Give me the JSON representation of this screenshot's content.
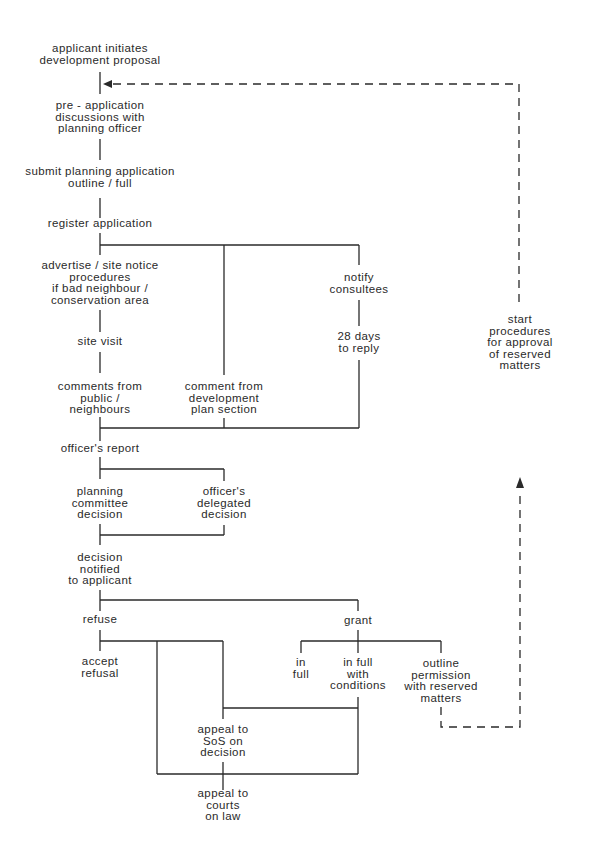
{
  "diagram": {
    "type": "flowchart",
    "colors": {
      "line": "#2a2a2a",
      "text": "#2a2a2a",
      "background": "#ffffff"
    },
    "nodes": {
      "applicant": "applicant initiates\ndevelopment proposal",
      "pre_app": "pre - application\ndiscussions with\nplanning officer",
      "submit": "submit planning application\noutline / full",
      "register": "register application",
      "advertise": "advertise / site notice\nprocedures\nif bad neighbour /\nconservation area",
      "site_visit": "site visit",
      "comments_public": "comments from\npublic /\nneighbours",
      "comment_devplan": "comment from\ndevelopment\nplan section",
      "notify": "notify\nconsultees",
      "days28": "28 days\nto reply",
      "officers_report": "officer's report",
      "committee": "planning\ncommittee\ndecision",
      "delegated": "officer's\ndelegated\ndecision",
      "notified": "decision\nnotified\nto applicant",
      "refuse": "refuse",
      "grant": "grant",
      "accept_refusal": "accept\nrefusal",
      "in_full": "in\nfull",
      "in_full_conditions": "in full\nwith\nconditions",
      "outline_permission": "outline\npermission\nwith reserved\nmatters",
      "appeal_sos": "appeal to\nSoS on\ndecision",
      "appeal_courts": "appeal to\ncourts\non law",
      "start_procedures": "start\nprocedures\nfor approval\nof reserved\nmatters"
    },
    "edges": [
      [
        "applicant",
        "pre_app"
      ],
      [
        "pre_app",
        "submit"
      ],
      [
        "submit",
        "register"
      ],
      [
        "register",
        "advertise"
      ],
      [
        "register",
        "comment_devplan"
      ],
      [
        "register",
        "notify"
      ],
      [
        "advertise",
        "site_visit"
      ],
      [
        "site_visit",
        "comments_public"
      ],
      [
        "notify",
        "days28"
      ],
      [
        "comments_public",
        "officers_report"
      ],
      [
        "comment_devplan",
        "officers_report"
      ],
      [
        "days28",
        "officers_report"
      ],
      [
        "officers_report",
        "committee"
      ],
      [
        "officers_report",
        "delegated"
      ],
      [
        "committee",
        "notified"
      ],
      [
        "delegated",
        "notified"
      ],
      [
        "notified",
        "refuse"
      ],
      [
        "notified",
        "grant"
      ],
      [
        "refuse",
        "accept_refusal"
      ],
      [
        "refuse",
        "appeal_sos"
      ],
      [
        "refuse",
        "appeal_courts"
      ],
      [
        "grant",
        "in_full"
      ],
      [
        "grant",
        "in_full_conditions"
      ],
      [
        "grant",
        "outline_permission"
      ],
      [
        "in_full_conditions",
        "appeal_sos"
      ],
      [
        "in_full_conditions",
        "appeal_courts"
      ],
      [
        "appeal_sos",
        "appeal_courts"
      ]
    ],
    "dashed_edges": [
      [
        "outline_permission",
        "start_procedures"
      ],
      [
        "start_procedures",
        "pre_app"
      ]
    ]
  }
}
